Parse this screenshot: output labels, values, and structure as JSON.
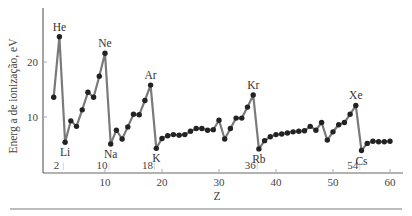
{
  "chart_data": {
    "type": "line",
    "title": "",
    "xlabel": "Z",
    "ylabel": "Energ a de ionização, eV",
    "xlim": [
      0,
      62
    ],
    "ylim": [
      0,
      30
    ],
    "x_ticks": [
      10,
      20,
      30,
      40,
      50,
      60
    ],
    "y_ticks": [
      10,
      20
    ],
    "grid": false,
    "legend": null,
    "line_color": "#7a7a7a",
    "marker_color": "#222222",
    "x": [
      1,
      2,
      3,
      4,
      5,
      6,
      7,
      8,
      9,
      10,
      11,
      12,
      13,
      14,
      15,
      16,
      17,
      18,
      19,
      20,
      21,
      22,
      23,
      24,
      25,
      26,
      27,
      28,
      29,
      30,
      31,
      32,
      33,
      34,
      35,
      36,
      37,
      38,
      39,
      40,
      41,
      42,
      43,
      44,
      45,
      46,
      47,
      48,
      49,
      50,
      51,
      52,
      53,
      54,
      55,
      56,
      57,
      58,
      59,
      60
    ],
    "values": [
      13.6,
      24.6,
      5.4,
      9.3,
      8.3,
      11.3,
      14.5,
      13.6,
      17.4,
      21.6,
      5.1,
      7.6,
      6.0,
      8.2,
      10.5,
      10.4,
      13.0,
      15.8,
      4.3,
      6.1,
      6.6,
      6.8,
      6.7,
      6.8,
      7.4,
      7.9,
      7.9,
      7.6,
      7.7,
      9.4,
      6.0,
      7.9,
      9.8,
      9.8,
      11.8,
      14.0,
      4.2,
      5.7,
      6.4,
      6.8,
      6.9,
      7.1,
      7.3,
      7.4,
      7.5,
      8.3,
      7.6,
      9.0,
      5.8,
      7.3,
      8.6,
      9.0,
      10.5,
      12.1,
      3.9,
      5.2,
      5.6,
      5.5,
      5.5,
      5.6
    ],
    "annotations": [
      {
        "text": "He",
        "z": 2,
        "position": "above"
      },
      {
        "text": "Ne",
        "z": 10,
        "position": "above"
      },
      {
        "text": "Ar",
        "z": 18,
        "position": "above"
      },
      {
        "text": "Kr",
        "z": 36,
        "position": "above"
      },
      {
        "text": "Xe",
        "z": 54,
        "position": "above"
      },
      {
        "text": "Li",
        "z": 3,
        "position": "below"
      },
      {
        "text": "Na",
        "z": 11,
        "position": "below"
      },
      {
        "text": "K",
        "z": 19,
        "position": "below"
      },
      {
        "text": "Rb",
        "z": 37,
        "position": "below"
      },
      {
        "text": "Cs",
        "z": 55,
        "position": "below"
      }
    ],
    "axis_markers": [
      {
        "text": "2",
        "z": 2
      },
      {
        "text": "10",
        "z": 10
      },
      {
        "text": "18",
        "z": 18
      },
      {
        "text": "36",
        "z": 36
      },
      {
        "text": "54",
        "z": 54
      }
    ]
  }
}
